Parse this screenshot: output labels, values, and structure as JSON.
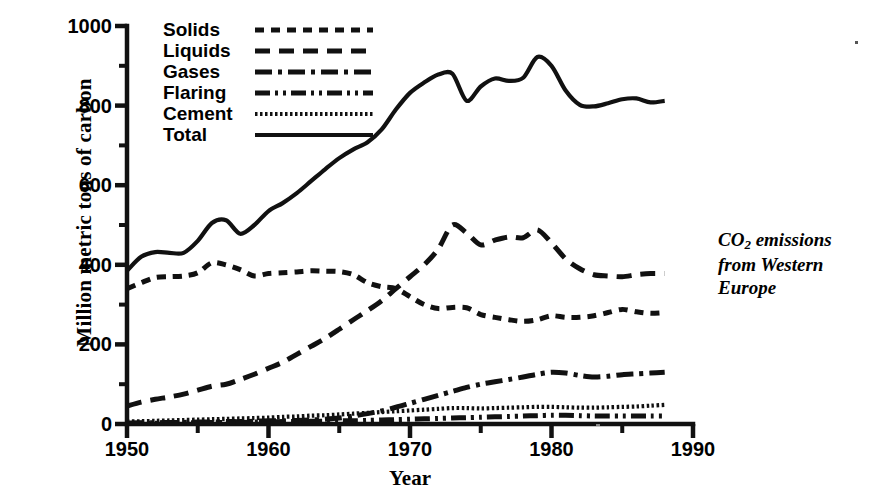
{
  "axes": {
    "y_title": "Million metric tons of carbon",
    "x_title": "Year",
    "y_ticks": [
      "0",
      "200",
      "400",
      "600",
      "800",
      "1000"
    ],
    "x_ticks": [
      "1950",
      "1960",
      "1970",
      "1980",
      "1990"
    ]
  },
  "legend": {
    "items": [
      {
        "label": "Solids",
        "style": "dotted-medium"
      },
      {
        "label": "Liquids",
        "style": "dashed"
      },
      {
        "label": "Gases",
        "style": "dash-dot"
      },
      {
        "label": "Flaring",
        "style": "dash-dot-dot"
      },
      {
        "label": "Cement",
        "style": "dotted-fine"
      },
      {
        "label": "Total",
        "style": "solid"
      }
    ]
  },
  "annotation": {
    "line1_pre": "CO",
    "line1_sub": "2",
    "line1_post": " emissions",
    "line2": "from Western",
    "line3": "Europe"
  },
  "chart_data": {
    "type": "line",
    "title": "CO2 emissions from Western Europe",
    "xlabel": "Year",
    "ylabel": "Million metric tons of carbon",
    "xlim": [
      1950,
      1990
    ],
    "ylim": [
      0,
      1000
    ],
    "xticks": [
      1950,
      1960,
      1970,
      1980,
      1990
    ],
    "yticks": [
      0,
      200,
      400,
      600,
      800,
      1000
    ],
    "minor_xtick_interval": 5,
    "minor_ytick_interval": 100,
    "grid": false,
    "legend_position": "top-left-inside",
    "line_color": "#111111",
    "x": [
      1950,
      1951,
      1952,
      1953,
      1954,
      1955,
      1956,
      1957,
      1958,
      1959,
      1960,
      1961,
      1962,
      1963,
      1964,
      1965,
      1966,
      1967,
      1968,
      1969,
      1970,
      1971,
      1972,
      1973,
      1974,
      1975,
      1976,
      1977,
      1978,
      1979,
      1980,
      1981,
      1982,
      1983,
      1984,
      1985,
      1986,
      1987,
      1988
    ],
    "series": [
      {
        "name": "Solids",
        "style": "dotted-medium",
        "values": [
          340,
          355,
          368,
          370,
          372,
          380,
          405,
          400,
          388,
          372,
          378,
          380,
          382,
          385,
          384,
          383,
          375,
          355,
          345,
          340,
          320,
          300,
          290,
          293,
          292,
          275,
          268,
          262,
          258,
          262,
          272,
          268,
          268,
          272,
          280,
          288,
          282,
          278,
          280
        ]
      },
      {
        "name": "Liquids",
        "style": "dashed",
        "values": [
          45,
          55,
          62,
          68,
          75,
          85,
          95,
          100,
          112,
          125,
          140,
          155,
          175,
          195,
          215,
          238,
          262,
          285,
          310,
          340,
          370,
          400,
          440,
          500,
          480,
          450,
          462,
          470,
          468,
          488,
          455,
          415,
          390,
          375,
          372,
          370,
          375,
          378,
          378
        ]
      },
      {
        "name": "Gases",
        "style": "dash-dot",
        "values": [
          2,
          3,
          3,
          4,
          4,
          5,
          5,
          6,
          6,
          7,
          8,
          8,
          9,
          10,
          12,
          15,
          20,
          26,
          33,
          42,
          52,
          62,
          72,
          82,
          92,
          100,
          106,
          112,
          118,
          125,
          130,
          128,
          122,
          118,
          120,
          124,
          126,
          128,
          130
        ]
      },
      {
        "name": "Flaring",
        "style": "dash-dot-dot",
        "values": [
          2,
          2,
          2,
          3,
          3,
          3,
          4,
          4,
          4,
          5,
          5,
          6,
          6,
          7,
          7,
          8,
          8,
          9,
          10,
          11,
          12,
          13,
          14,
          15,
          16,
          17,
          18,
          19,
          20,
          21,
          22,
          22,
          21,
          20,
          20,
          20,
          20,
          20,
          20
        ]
      },
      {
        "name": "Cement",
        "style": "dotted-fine",
        "values": [
          6,
          7,
          8,
          9,
          10,
          11,
          12,
          13,
          14,
          15,
          16,
          18,
          19,
          21,
          22,
          24,
          26,
          28,
          30,
          32,
          34,
          36,
          38,
          40,
          40,
          39,
          40,
          41,
          42,
          43,
          43,
          42,
          41,
          41,
          42,
          43,
          44,
          46,
          48
        ]
      },
      {
        "name": "Total",
        "style": "solid",
        "values": [
          385,
          420,
          432,
          430,
          430,
          460,
          505,
          512,
          478,
          500,
          535,
          555,
          580,
          610,
          640,
          668,
          690,
          708,
          740,
          790,
          832,
          858,
          878,
          880,
          812,
          848,
          868,
          862,
          870,
          922,
          900,
          838,
          802,
          798,
          806,
          816,
          818,
          808,
          812
        ]
      }
    ]
  }
}
